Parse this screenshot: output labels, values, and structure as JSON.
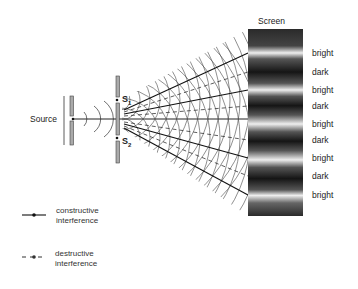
{
  "diagram": {
    "labels": {
      "screen": "Screen",
      "source": "Source",
      "slit1": "S",
      "slit1_sub": "1",
      "slit2": "S",
      "slit2_sub": "2"
    },
    "fringes": [
      {
        "label": "bright",
        "y": 53
      },
      {
        "label": "dark",
        "y": 72
      },
      {
        "label": "bright",
        "y": 90
      },
      {
        "label": "dark",
        "y": 106
      },
      {
        "label": "bright",
        "y": 124
      },
      {
        "label": "dark",
        "y": 140
      },
      {
        "label": "bright",
        "y": 158
      },
      {
        "label": "dark",
        "y": 176
      },
      {
        "label": "bright",
        "y": 195
      }
    ],
    "legend": [
      {
        "style": "solid",
        "line1": "constructive",
        "line2": "interference"
      },
      {
        "style": "dashed",
        "line1": "destructive",
        "line2": "interference"
      }
    ],
    "colors": {
      "line": "#222222",
      "barrier": "#999999",
      "screen_dark": "#1a1a1a",
      "screen_bright": "#f2f2f2"
    }
  }
}
